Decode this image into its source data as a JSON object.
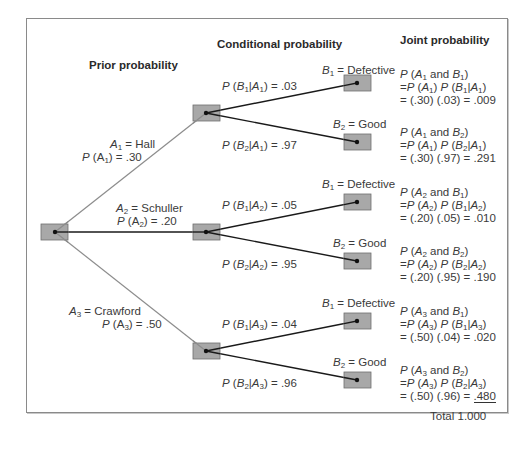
{
  "headers": {
    "prior": "Prior probability",
    "conditional": "Conditional probability",
    "joint": "Joint probability"
  },
  "suppliers": [
    {
      "name": "Hall",
      "event": "A1",
      "prior_label": "P (A1) = .30",
      "prior": 0.3
    },
    {
      "name": "Schuller",
      "event": "A2",
      "prior_label": "P (A2) = .20",
      "prior": 0.2
    },
    {
      "name": "Crawford",
      "event": "A3",
      "prior_label": "P (A3) = .50",
      "prior": 0.5
    }
  ],
  "outcomes": {
    "b1": "Defective",
    "b2": "Good"
  },
  "conditional": [
    {
      "b1": ".03",
      "b2": ".97"
    },
    {
      "b1": ".05",
      "b2": ".95"
    },
    {
      "b1": ".04",
      "b2": ".96"
    }
  ],
  "joint": [
    {
      "b1_calc": "= (.30) (.03) = .009",
      "b1_value": ".009",
      "b2_calc": "= (.30) (.97) = .291",
      "b2_value": ".291"
    },
    {
      "b1_calc": "= (.20) (.05) = .010",
      "b1_value": ".010",
      "b2_calc": "= (.20) (.95) = .190",
      "b2_value": ".190"
    },
    {
      "b1_calc": "= (.50) (.04) = .020",
      "b1_value": ".020",
      "b2_calc_prefix": "= (.50) (.96) = ",
      "b2_value": ".480"
    }
  ],
  "total": "Total 1.000",
  "colors": {
    "node_fill": "#a8a8a8",
    "node_border": "#6e6e6e",
    "branch_primary": "#8c8c8c",
    "branch_secondary": "#1a1a1a",
    "frame": "#8a8a8a"
  }
}
